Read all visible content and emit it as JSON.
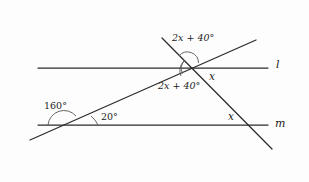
{
  "figure": {
    "kind": "geometry-diagram",
    "background_color": "#fdfdfd",
    "line_color": "#2b2b2b",
    "arc_color": "#555555",
    "text_color": "#1c1c1c",
    "line_labels": {
      "upper": "l",
      "lower": "m"
    },
    "angle_labels": {
      "top_transversal_above": "2x + 40°",
      "below_line_l": "2x + 40°",
      "right_of_intersection": "x",
      "lower_left_exterior": "160°",
      "lower_left_interior": "20°",
      "above_line_m": "x"
    },
    "expressions": {
      "two_x_plus_forty_coefficient": "2x",
      "two_x_plus_forty_constant": "40",
      "degree_symbol": "°",
      "unknown": "x",
      "angle_160": "160",
      "angle_20": "20"
    }
  }
}
